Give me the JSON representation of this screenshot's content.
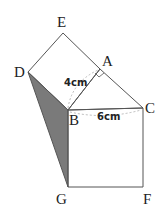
{
  "diagram": {
    "points": {
      "E": {
        "label": "E",
        "x": 63,
        "y": 33
      },
      "A": {
        "label": "A",
        "x": 100,
        "y": 69
      },
      "D": {
        "label": "D",
        "x": 28,
        "y": 72
      },
      "B": {
        "label": "B",
        "x": 68,
        "y": 110
      },
      "C": {
        "label": "C",
        "x": 143,
        "y": 108
      },
      "G": {
        "label": "G",
        "x": 68,
        "y": 187
      },
      "F": {
        "label": "F",
        "x": 143,
        "y": 187
      }
    },
    "measurements": {
      "AB": "4cm",
      "BC": "6cm"
    },
    "shaded_region": "triangle DBG",
    "colors": {
      "line": "#555555",
      "shade": "#7a7a7a",
      "dashed": "#aaaaaa"
    }
  }
}
